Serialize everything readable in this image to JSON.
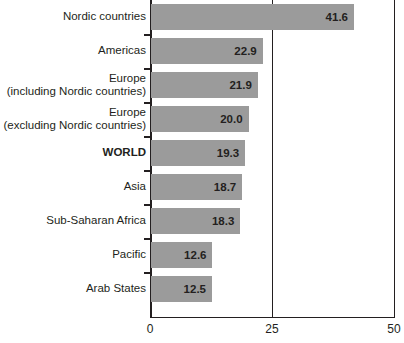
{
  "chart_data": {
    "type": "bar",
    "orientation": "horizontal",
    "title": "",
    "subtitle": "",
    "xlabel": "",
    "ylabel": "",
    "xlim": [
      0,
      50
    ],
    "xticks": [
      "0",
      "25",
      "50"
    ],
    "xtick_values": [
      0,
      25,
      50
    ],
    "grid": "vertical gridlines at 0, 25 and 50",
    "legend": "none",
    "bar_color": "#9b9b9b",
    "axis_color": "#231f20",
    "categories": [
      "Nordic countries",
      "Americas",
      "Europe (including Nordic countries)",
      "Europe (excluding Nordic countries)",
      "WORLD",
      "Asia",
      "Sub-Saharan Africa",
      "Pacific",
      "Arab States"
    ],
    "values": [
      41.6,
      22.9,
      21.9,
      20.0,
      19.3,
      18.7,
      18.3,
      12.6,
      12.5
    ],
    "value_labels": [
      "41.6",
      "22.9",
      "21.9",
      "20.0",
      "19.3",
      "18.7",
      "18.3",
      "12.6",
      "12.5"
    ]
  },
  "rows": [
    {
      "label_line1": "Nordic countries",
      "label_line2": "",
      "bold": false,
      "value": 41.6,
      "value_label": "41.6"
    },
    {
      "label_line1": "Americas",
      "label_line2": "",
      "bold": false,
      "value": 22.9,
      "value_label": "22.9"
    },
    {
      "label_line1": "Europe",
      "label_line2": "(including Nordic countries)",
      "bold": false,
      "value": 21.9,
      "value_label": "21.9"
    },
    {
      "label_line1": "Europe",
      "label_line2": "(excluding Nordic countries)",
      "bold": false,
      "value": 20.0,
      "value_label": "20.0"
    },
    {
      "label_line1": "WORLD",
      "label_line2": "",
      "bold": true,
      "value": 19.3,
      "value_label": "19.3"
    },
    {
      "label_line1": "Asia",
      "label_line2": "",
      "bold": false,
      "value": 18.7,
      "value_label": "18.7"
    },
    {
      "label_line1": "Sub-Saharan Africa",
      "label_line2": "",
      "bold": false,
      "value": 18.3,
      "value_label": "18.3"
    },
    {
      "label_line1": "Pacific",
      "label_line2": "",
      "bold": false,
      "value": 12.6,
      "value_label": "12.6"
    },
    {
      "label_line1": "Arab States",
      "label_line2": "",
      "bold": false,
      "value": 12.5,
      "value_label": "12.5"
    }
  ],
  "axis": {
    "ticks": [
      {
        "label": "0",
        "value": 0
      },
      {
        "label": "25",
        "value": 25
      },
      {
        "label": "50",
        "value": 50
      }
    ]
  }
}
